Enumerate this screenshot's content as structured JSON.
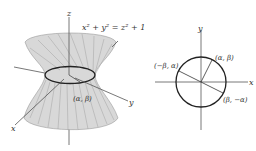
{
  "left_figure": {
    "title": "hyperboloid of one sheet",
    "equation": "x² + y² = z² + 1",
    "axis_labels": {
      "x": "x",
      "y": "y",
      "z": "z"
    },
    "point_label": "(α, β)",
    "surface_color": "#d4d4d4",
    "ruling_color": "#9a9a9a",
    "waist_circle_color": "#222222"
  },
  "right_figure": {
    "title": "unit circle",
    "axis_labels": {
      "x": "x",
      "y": "y"
    },
    "points": [
      {
        "label": "(α, β)"
      },
      {
        "label": "(−β, α)"
      },
      {
        "label": "(β, −α)"
      }
    ],
    "circle_color": "#222222"
  }
}
